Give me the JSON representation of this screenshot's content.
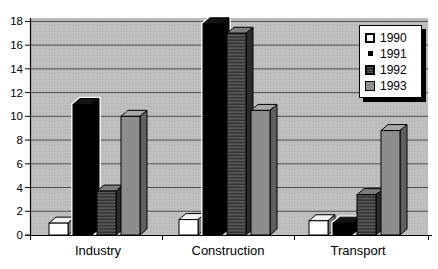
{
  "chart_data": {
    "type": "bar",
    "style": "3d-column",
    "title": "",
    "xlabel": "",
    "ylabel": "",
    "categories": [
      "Industry",
      "Construction",
      "Transport"
    ],
    "series": [
      {
        "name": "1990",
        "values": [
          1.0,
          1.3,
          1.2
        ],
        "front": "#ffffff",
        "top": "#f2f2f2",
        "side": "#7d7d7d",
        "halo": false
      },
      {
        "name": "1991",
        "values": [
          11.0,
          17.8,
          1.0
        ],
        "front": "#000000",
        "top": "#141414",
        "side": "#000000",
        "halo": true
      },
      {
        "name": "1992",
        "values": [
          3.7,
          17.0,
          3.4
        ],
        "front": "hatch",
        "top": "#7d7d7d",
        "side": "#2b2b2b",
        "halo": false
      },
      {
        "name": "1993",
        "values": [
          10.0,
          10.5,
          8.8
        ],
        "front": "#8d8d8d",
        "top": "#a8a8a8",
        "side": "#606060",
        "halo": false
      }
    ],
    "ylim": [
      0,
      18
    ],
    "yticks": [
      0,
      2,
      4,
      6,
      8,
      10,
      12,
      14,
      16,
      18
    ],
    "grid": true,
    "legend_position": "top-right",
    "colors": {
      "plot_bg": "#c0c0c0",
      "plot_bg_dot": "#a6a6a6",
      "grid": "#4f4f4f",
      "axis": "#000000",
      "hatch_bg": "#5a5a5a",
      "hatch_line": "#2e2e2e",
      "outline": "#000000",
      "background": "#ffffff",
      "legend_bg": "#ffffff",
      "legend_border": "#000000",
      "legend_shadow": "#000000"
    }
  }
}
